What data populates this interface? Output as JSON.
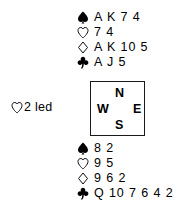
{
  "suits": {
    "spade": {
      "name": "spade-symbol",
      "glyph": "♠",
      "fill": "solid",
      "color": "#000000"
    },
    "heart": {
      "name": "heart-symbol",
      "glyph": "♡",
      "fill": "outline",
      "color": "#000000"
    },
    "diamond": {
      "name": "diamond-symbol",
      "glyph": "♢",
      "fill": "outline",
      "color": "#000000"
    },
    "club": {
      "name": "club-symbol",
      "glyph": "♣",
      "fill": "solid",
      "color": "#000000"
    }
  },
  "north": {
    "label": "North",
    "spades": "A K 7 4",
    "hearts": "7 4",
    "diamonds": "A K 10 5",
    "clubs": "A J 5"
  },
  "south": {
    "label": "South",
    "spades": "8 2",
    "hearts": "9 5",
    "diamonds": "9 6 2",
    "clubs": "Q 10 7 6 4 2"
  },
  "compass": {
    "north": "N",
    "west": "W",
    "east": "E",
    "south": "S"
  },
  "lead": {
    "suit": "heart",
    "text": "2 led"
  },
  "colors": {
    "background": "#ffffff",
    "ink": "#000000",
    "box_border": "#1a1a1a"
  }
}
